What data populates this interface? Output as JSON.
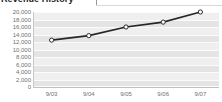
{
  "chart_data": {
    "type": "line",
    "title": "Revenue History",
    "xlabel": "",
    "ylabel": "",
    "categories": [
      "9/03",
      "9/04",
      "9/05",
      "9/06",
      "9/07"
    ],
    "series": [
      {
        "name": "Revenue",
        "values": [
          12500,
          13700,
          16000,
          17300,
          20000
        ]
      }
    ],
    "ylim": [
      0,
      20000
    ],
    "ytick_labels": [
      "20,000",
      "18,000",
      "16,000",
      "14,000",
      "12,000",
      "10,000",
      "8,000",
      "6,000",
      "4,000",
      "2,000",
      "0"
    ],
    "ytick_values": [
      20000,
      18000,
      16000,
      14000,
      12000,
      10000,
      8000,
      6000,
      4000,
      2000,
      0
    ],
    "grid": true,
    "legend": "none",
    "marker": "open-circle",
    "colors": {
      "line": "#262626",
      "marker_fill": "#ffffff",
      "plot_band": "#e4e4e4",
      "plot_background": "#efefef",
      "gridline": "#fbfbfb",
      "tick_label": "#707070",
      "title": "#1b1b1b"
    }
  }
}
